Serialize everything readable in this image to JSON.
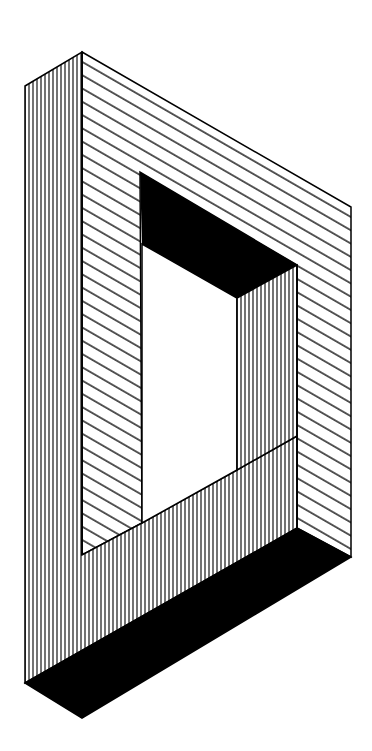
{
  "figure": {
    "style": "black ink hatched line art on white",
    "colors": {
      "ink": "#000000",
      "paper": "#ffffff"
    },
    "faces": [
      {
        "name": "left-outer-face",
        "hatch": "vertical",
        "points": [
          [
            25,
            86
          ],
          [
            82,
            52
          ],
          [
            82,
            245
          ],
          [
            25,
            683
          ]
        ]
      },
      {
        "name": "front-top-face",
        "hatch": "diagonal",
        "points": [
          [
            82,
            52
          ],
          [
            351,
            207
          ],
          [
            351,
            557
          ],
          [
            297,
            528
          ],
          [
            297,
            265
          ],
          [
            140,
            172
          ],
          [
            142,
            523
          ],
          [
            82,
            555
          ]
        ]
      },
      {
        "name": "hole-top-face",
        "fill": "solid",
        "points": [
          [
            140,
            172
          ],
          [
            297,
            265
          ],
          [
            237,
            298
          ],
          [
            142,
            244
          ]
        ]
      },
      {
        "name": "hole-right-face",
        "hatch": "vertical",
        "points": [
          [
            237,
            298
          ],
          [
            297,
            265
          ],
          [
            297,
            528
          ],
          [
            237,
            470
          ]
        ]
      },
      {
        "name": "bottom-front-face",
        "hatch": "vertical",
        "points": [
          [
            25,
            683
          ],
          [
            25,
            86
          ],
          [
            82,
            52
          ],
          [
            82,
            555
          ],
          [
            142,
            523
          ],
          [
            237,
            470
          ],
          [
            297,
            528
          ],
          [
            297,
            528
          ]
        ]
      },
      {
        "name": "bottom-slab-face",
        "fill": "solid",
        "points": [
          [
            25,
            683
          ],
          [
            297,
            528
          ],
          [
            351,
            557
          ],
          [
            82,
            718
          ]
        ]
      }
    ]
  }
}
